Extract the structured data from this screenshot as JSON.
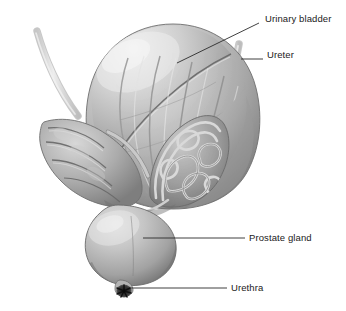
{
  "figure": {
    "type": "anatomical-illustration",
    "style": "grayscale medical illustration",
    "background_color": "#ffffff",
    "label_color": "#1a1a1a",
    "leader_color": "#2b2b2b"
  },
  "labels": [
    {
      "id": "urinary-bladder",
      "text": "Urinary bladder",
      "x": 262,
      "y": 19
    },
    {
      "id": "ureter",
      "text": "Ureter",
      "x": 266,
      "y": 55
    },
    {
      "id": "prostate-gland",
      "text": "Prostate gland",
      "x": 248,
      "y": 233
    },
    {
      "id": "urethra",
      "text": "Urethra",
      "x": 230,
      "y": 283
    }
  ],
  "leaders": [
    {
      "id": "leader-urinary-bladder",
      "points": "259,23 177,63"
    },
    {
      "id": "leader-ureter",
      "points": "263,59 241,59"
    },
    {
      "id": "leader-prostate-gland",
      "points": "245,238 143,238"
    },
    {
      "id": "leader-urethra",
      "points": "227,288 130,288"
    }
  ],
  "structures": [
    {
      "id": "bladder-dome",
      "name": "Urinary bladder"
    },
    {
      "id": "detrusor-fibers",
      "name": "Bladder muscle striations"
    },
    {
      "id": "ureter-left",
      "name": "Left ureter"
    },
    {
      "id": "ureter-right",
      "name": "Right ureter"
    },
    {
      "id": "seminal-vesicle-left",
      "name": "Left seminal vesicle"
    },
    {
      "id": "seminal-vesicle-right",
      "name": "Right seminal vesicle, cutaway"
    },
    {
      "id": "prostate-gland",
      "name": "Prostate gland"
    },
    {
      "id": "urethral-orifice",
      "name": "Urethral opening"
    }
  ]
}
